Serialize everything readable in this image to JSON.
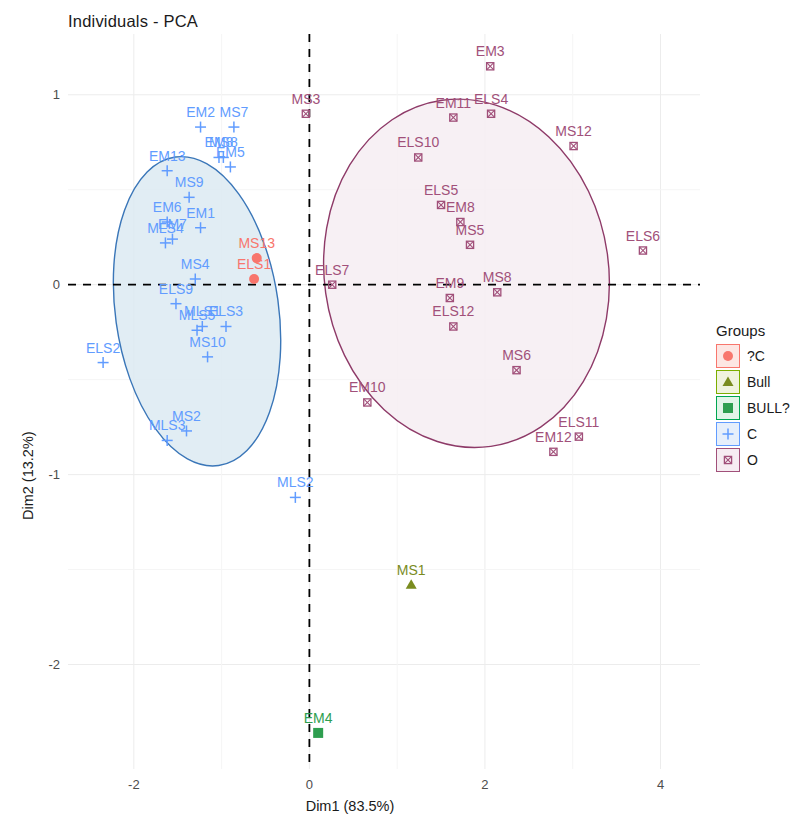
{
  "chart_data": {
    "type": "scatter",
    "title": "Individuals - PCA",
    "xlabel": "Dim1 (83.5%)",
    "ylabel": "Dim2 (13.2%)",
    "xlim": [
      -2.75,
      4.45
    ],
    "ylim": [
      -2.55,
      1.32
    ],
    "xticks": [
      "-2",
      "0",
      "2",
      "4"
    ],
    "xtick_values": [
      -2,
      0,
      2,
      4
    ],
    "yticks": [
      "1",
      "0",
      "-1",
      "-2"
    ],
    "ytick_values": [
      1,
      0,
      -1,
      -2
    ],
    "grid": true,
    "legend_position": "right",
    "reference_lines": {
      "x": 0,
      "y": 0,
      "style": "dashed",
      "color": "#000000"
    },
    "groups": [
      {
        "name": "?C",
        "color": "#F8766D",
        "marker": "circle"
      },
      {
        "name": "Bull",
        "color": "#7CAE00",
        "marker": "triangle"
      },
      {
        "name": "BULL?",
        "color": "#00A651",
        "marker": "square"
      },
      {
        "name": "C",
        "color": "#619CFF",
        "marker": "plus"
      },
      {
        "name": "O",
        "color": "#A1507A",
        "marker": "square-x"
      }
    ],
    "ellipses": [
      {
        "group": "C",
        "cx": -1.28,
        "cy": -0.14,
        "rx": 0.93,
        "ry": 0.82,
        "rotation": -8,
        "stroke": "#3A76B8",
        "fill": "#DCEAF2"
      },
      {
        "group": "O",
        "cx": 1.79,
        "cy": 0.06,
        "rx": 1.62,
        "ry": 0.92,
        "rotation": -8,
        "stroke": "#8E3A68",
        "fill": "#F6EDF2"
      }
    ],
    "points": [
      {
        "label": "EM2",
        "x": -1.24,
        "y": 0.83,
        "group": "C"
      },
      {
        "label": "MS7",
        "x": -0.86,
        "y": 0.83,
        "group": "C"
      },
      {
        "label": "EM8",
        "x": -1.03,
        "y": 0.67,
        "group": "C"
      },
      {
        "label": "MS8",
        "x": -0.98,
        "y": 0.67,
        "group": "C"
      },
      {
        "label": "EM5",
        "x": -0.9,
        "y": 0.62,
        "group": "C"
      },
      {
        "label": "EM13",
        "x": -1.62,
        "y": 0.6,
        "group": "C"
      },
      {
        "label": "MS9",
        "x": -1.37,
        "y": 0.46,
        "group": "C"
      },
      {
        "label": "EM6",
        "x": -1.62,
        "y": 0.33,
        "group": "C"
      },
      {
        "label": "EM1",
        "x": -1.24,
        "y": 0.3,
        "group": "C"
      },
      {
        "label": "EM7",
        "x": -1.56,
        "y": 0.24,
        "group": "C"
      },
      {
        "label": "MLS4",
        "x": -1.64,
        "y": 0.22,
        "group": "C"
      },
      {
        "label": "MS4",
        "x": -1.3,
        "y": 0.03,
        "group": "C"
      },
      {
        "label": "ELS9",
        "x": -1.52,
        "y": -0.1,
        "group": "C"
      },
      {
        "label": "MLS5",
        "x": -1.28,
        "y": -0.24,
        "group": "C"
      },
      {
        "label": "MLS1",
        "x": -1.22,
        "y": -0.22,
        "group": "C"
      },
      {
        "label": "ELS3",
        "x": -0.95,
        "y": -0.22,
        "group": "C"
      },
      {
        "label": "MS10",
        "x": -1.16,
        "y": -0.38,
        "group": "C"
      },
      {
        "label": "ELS2",
        "x": -2.35,
        "y": -0.41,
        "group": "C"
      },
      {
        "label": "MS2",
        "x": -1.4,
        "y": -0.77,
        "group": "C"
      },
      {
        "label": "MLS3",
        "x": -1.62,
        "y": -0.82,
        "group": "C"
      },
      {
        "label": "MLS2",
        "x": -0.16,
        "y": -1.12,
        "group": "C"
      },
      {
        "label": "MS13",
        "x": -0.6,
        "y": 0.14,
        "group": "?C"
      },
      {
        "label": "ELS1",
        "x": -0.63,
        "y": 0.03,
        "group": "?C"
      },
      {
        "label": "MS1",
        "x": 1.16,
        "y": -1.58,
        "group": "Bull"
      },
      {
        "label": "EM4",
        "x": 0.1,
        "y": -2.36,
        "group": "BULL?"
      },
      {
        "label": "EM3",
        "x": 2.06,
        "y": 1.15,
        "group": "O"
      },
      {
        "label": "MS3",
        "x": -0.04,
        "y": 0.9,
        "group": "O"
      },
      {
        "label": "EM11",
        "x": 1.64,
        "y": 0.88,
        "group": "O"
      },
      {
        "label": "ELS4",
        "x": 2.07,
        "y": 0.9,
        "group": "O"
      },
      {
        "label": "MS12",
        "x": 3.01,
        "y": 0.73,
        "group": "O"
      },
      {
        "label": "ELS10",
        "x": 1.24,
        "y": 0.67,
        "group": "O"
      },
      {
        "label": "ELS5",
        "x": 1.5,
        "y": 0.42,
        "group": "O"
      },
      {
        "label": "EM8b",
        "x": 1.72,
        "y": 0.33,
        "group": "O"
      },
      {
        "label": "MS5",
        "x": 1.83,
        "y": 0.21,
        "group": "O"
      },
      {
        "label": "ELS6",
        "x": 3.8,
        "y": 0.18,
        "group": "O"
      },
      {
        "label": "ELS7",
        "x": 0.26,
        "y": 0.0,
        "group": "O"
      },
      {
        "label": "EM9",
        "x": 1.6,
        "y": -0.07,
        "group": "O"
      },
      {
        "label": "MS8b",
        "x": 2.14,
        "y": -0.04,
        "group": "O"
      },
      {
        "label": "ELS12",
        "x": 1.64,
        "y": -0.22,
        "group": "O"
      },
      {
        "label": "MS6",
        "x": 2.36,
        "y": -0.45,
        "group": "O"
      },
      {
        "label": "EM10",
        "x": 0.66,
        "y": -0.62,
        "group": "O"
      },
      {
        "label": "ELS11",
        "x": 3.07,
        "y": -0.8,
        "group": "O"
      },
      {
        "label": "EM12",
        "x": 2.78,
        "y": -0.88,
        "group": "O"
      }
    ],
    "point_display_labels": {
      "EM8b": "EM8",
      "MS8b": "MS8"
    }
  },
  "legend": {
    "title": "Groups",
    "items": [
      {
        "label": "?C"
      },
      {
        "label": "Bull"
      },
      {
        "label": "BULL?"
      },
      {
        "label": "C"
      },
      {
        "label": "O"
      }
    ]
  }
}
